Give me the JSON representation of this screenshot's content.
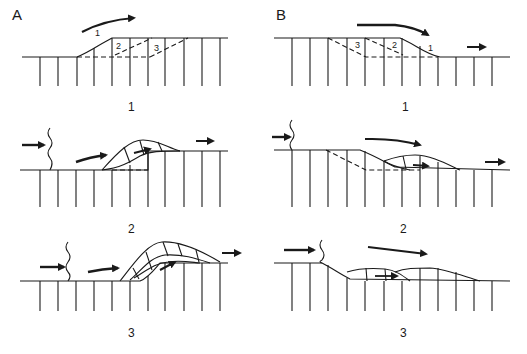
{
  "panels": {
    "A": {
      "label": "A",
      "steps": [
        {
          "label": "1",
          "markers": [
            "1",
            "2",
            "3"
          ]
        },
        {
          "label": "2"
        },
        {
          "label": "3"
        }
      ]
    },
    "B": {
      "label": "B",
      "steps": [
        {
          "label": "1",
          "markers": [
            "3",
            "2",
            "1"
          ]
        },
        {
          "label": "2"
        },
        {
          "label": "3"
        }
      ]
    }
  },
  "colors": {
    "ink": "#1a1a1a",
    "background": "#ffffff"
  }
}
